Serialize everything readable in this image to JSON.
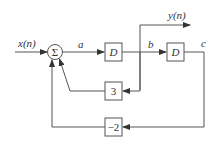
{
  "diagram": {
    "type": "block-diagram",
    "input_label": "x(n)",
    "output_label": "y(n)",
    "summer_symbol": "Σ",
    "signals": {
      "a": "a",
      "b": "b",
      "c": "c"
    },
    "blocks": {
      "delay1": "D",
      "delay2": "D",
      "gain_feedback_b": "3",
      "gain_feedback_c": "−2"
    },
    "colors": {
      "line": "#555555",
      "text": "#333333",
      "background": "#ffffff"
    }
  }
}
